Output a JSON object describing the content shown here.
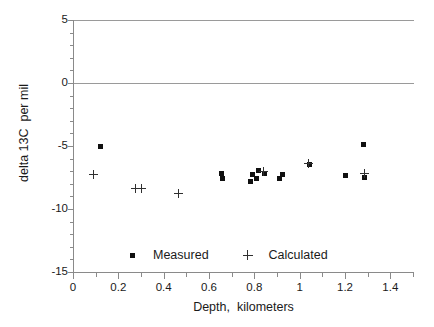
{
  "chart_data": {
    "type": "scatter",
    "title": "",
    "xlabel": "Depth,  kilometers",
    "ylabel": "delta 13C  per mil",
    "xlim": [
      0,
      1.5
    ],
    "ylim": [
      -15,
      5
    ],
    "xticks": [
      0,
      0.2,
      0.4,
      0.6,
      0.8,
      1,
      1.2,
      1.4
    ],
    "xtick_labels": [
      "0",
      "0.2",
      "0.4",
      "0.6",
      "0.8",
      "1",
      "1.2",
      "1.4"
    ],
    "yticks": [
      5,
      0,
      -5,
      -10,
      -15
    ],
    "ytick_labels": [
      "5",
      "0",
      "-5",
      "-10",
      "-15"
    ],
    "x_minor_tick_step": 0.1,
    "y_minor_tick_step": 1,
    "grid": false,
    "zero_line": true,
    "legend_position": "inside-bottom-center",
    "series": [
      {
        "name": "Measured",
        "marker": "square",
        "color": "#101010",
        "points": [
          {
            "x": 0.12,
            "y": -5.05
          },
          {
            "x": 0.655,
            "y": -7.15
          },
          {
            "x": 0.66,
            "y": -7.55
          },
          {
            "x": 0.79,
            "y": -7.3
          },
          {
            "x": 0.785,
            "y": -7.85
          },
          {
            "x": 0.82,
            "y": -6.95
          },
          {
            "x": 0.845,
            "y": -7.2
          },
          {
            "x": 0.81,
            "y": -7.6
          },
          {
            "x": 0.925,
            "y": -7.25
          },
          {
            "x": 0.91,
            "y": -7.55
          },
          {
            "x": 1.045,
            "y": -6.5
          },
          {
            "x": 1.2,
            "y": -7.35
          },
          {
            "x": 1.28,
            "y": -4.85
          },
          {
            "x": 1.285,
            "y": -7.5
          }
        ]
      },
      {
        "name": "Calculated",
        "marker": "plus",
        "color": "#303030",
        "points": [
          {
            "x": 0.09,
            "y": -7.25
          },
          {
            "x": 0.275,
            "y": -8.4
          },
          {
            "x": 0.3,
            "y": -8.4
          },
          {
            "x": 0.465,
            "y": -8.75
          },
          {
            "x": 0.84,
            "y": -7.0
          },
          {
            "x": 1.04,
            "y": -6.35
          },
          {
            "x": 1.285,
            "y": -7.2
          }
        ]
      }
    ]
  },
  "legend": {
    "measured_label": "Measured",
    "calculated_label": "Calculated"
  }
}
